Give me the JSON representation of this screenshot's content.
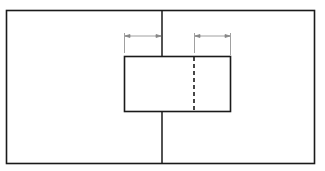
{
  "diagram": {
    "colors": {
      "stroke": "#1a1a1a",
      "dim_stroke": "#888888",
      "background": "#ffffff"
    },
    "outer_rect": {
      "x": 6,
      "y": 10,
      "width": 308,
      "height": 153
    },
    "center_line_x": 162,
    "inner_rect": {
      "x": 124,
      "y": 56,
      "width": 106,
      "height": 55
    },
    "dashed_line_x": 194,
    "dimensions": [
      {
        "name": "left-dimension",
        "x1": 124,
        "x2": 162,
        "y": 36,
        "label": ""
      },
      {
        "name": "right-dimension",
        "x1": 194,
        "x2": 230,
        "y": 36,
        "label": ""
      }
    ]
  }
}
